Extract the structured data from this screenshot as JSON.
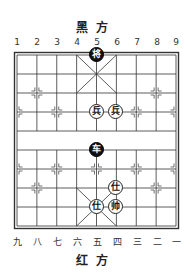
{
  "top_side": {
    "label": "黑方"
  },
  "bottom_side": {
    "label": "红方"
  },
  "top_columns": [
    "1",
    "2",
    "3",
    "4",
    "5",
    "6",
    "7",
    "8",
    "9"
  ],
  "bottom_columns": [
    "九",
    "八",
    "七",
    "六",
    "五",
    "四",
    "三",
    "二",
    "一"
  ],
  "board": {
    "files": 9,
    "ranks": 10,
    "line_color": "#333333",
    "border_color": "#333333"
  },
  "pieces": [
    {
      "name": "black-general",
      "char": "将",
      "side": "black",
      "file": 5,
      "rank": 0
    },
    {
      "name": "red-soldier",
      "char": "兵",
      "side": "red",
      "file": 5,
      "rank": 3
    },
    {
      "name": "red-soldier",
      "char": "兵",
      "side": "red",
      "file": 6,
      "rank": 3
    },
    {
      "name": "black-chariot",
      "char": "车",
      "side": "black",
      "file": 5,
      "rank": 5
    },
    {
      "name": "red-advisor",
      "char": "仕",
      "side": "red",
      "file": 6,
      "rank": 7
    },
    {
      "name": "red-advisor",
      "char": "仕",
      "side": "red",
      "file": 5,
      "rank": 8
    },
    {
      "name": "red-general",
      "char": "帅",
      "side": "red",
      "file": 6,
      "rank": 8
    }
  ]
}
